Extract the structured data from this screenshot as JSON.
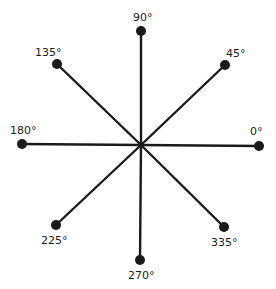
{
  "diagram": {
    "title": "",
    "type": "direction-rose",
    "center": {
      "x": 141,
      "y": 145
    },
    "line_color": "#1a1a1a",
    "line_width": 2.4,
    "dot_radius": 5,
    "spokes": [
      {
        "angle_label": "0°",
        "x": 259,
        "y": 146,
        "label_x": 250,
        "label_y": 126
      },
      {
        "angle_label": "45°",
        "x": 225,
        "y": 65,
        "label_x": 226,
        "label_y": 48
      },
      {
        "angle_label": "90°",
        "x": 141,
        "y": 31,
        "label_x": 133,
        "label_y": 12
      },
      {
        "angle_label": "135°",
        "x": 57,
        "y": 64,
        "label_x": 35,
        "label_y": 47
      },
      {
        "angle_label": "180°",
        "x": 22,
        "y": 144,
        "label_x": 10,
        "label_y": 125
      },
      {
        "angle_label": "225°",
        "x": 56,
        "y": 225,
        "label_x": 41,
        "label_y": 235
      },
      {
        "angle_label": "270°",
        "x": 140,
        "y": 260,
        "label_x": 128,
        "label_y": 270
      },
      {
        "angle_label": "335°",
        "x": 224,
        "y": 227,
        "label_x": 211,
        "label_y": 237
      }
    ]
  }
}
